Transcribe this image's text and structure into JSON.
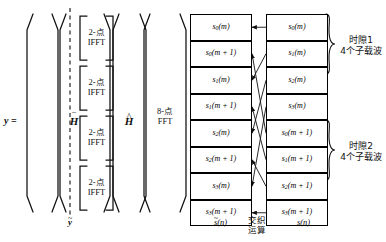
{
  "equation": {
    "lhs": "y =",
    "matrix_1": "H",
    "matrix_1_accent": "bar",
    "matrix_2": "H",
    "matrix_2_accent": "hat"
  },
  "ifft_blocks": [
    {
      "line1": "2-点",
      "line2": "IFFT"
    },
    {
      "line1": "2-点",
      "line2": "IFFT"
    },
    {
      "line1": "2-点",
      "line2": "IFFT"
    },
    {
      "line1": "2-点",
      "line2": "IFFT"
    }
  ],
  "fft_block": {
    "line1": "8-点",
    "line2": "FFT"
  },
  "intermediate_label": {
    "base": "y",
    "accent": "tilde"
  },
  "left_column": {
    "name": "s-tilde-column",
    "bottom_label": {
      "base": "s",
      "accent": "tilde",
      "arg": "(n)"
    },
    "cells": [
      {
        "sym": "s",
        "sub": "0",
        "arg": "(m)"
      },
      {
        "sym": "s",
        "sub": "0",
        "arg": "(m + 1)"
      },
      {
        "sym": "s",
        "sub": "1",
        "arg": "(m)"
      },
      {
        "sym": "s",
        "sub": "1",
        "arg": "(m + 1)"
      },
      {
        "sym": "s",
        "sub": "2",
        "arg": "(m)"
      },
      {
        "sym": "s",
        "sub": "2",
        "arg": "(m + 1)"
      },
      {
        "sym": "s",
        "sub": "3",
        "arg": "(m)"
      },
      {
        "sym": "s",
        "sub": "3",
        "arg": "(m + 1)"
      }
    ]
  },
  "right_column": {
    "name": "s-column",
    "bottom_label": {
      "base": "s",
      "accent": "none",
      "arg": "(n)"
    },
    "cells": [
      {
        "sym": "s",
        "sub": "0",
        "arg": "(m)"
      },
      {
        "sym": "s",
        "sub": "1",
        "arg": "(m)"
      },
      {
        "sym": "s",
        "sub": "2",
        "arg": "(m)"
      },
      {
        "sym": "s",
        "sub": "3",
        "arg": "(m)"
      },
      {
        "sym": "s",
        "sub": "0",
        "arg": "(m + 1)"
      },
      {
        "sym": "s",
        "sub": "1",
        "arg": "(m + 1)"
      },
      {
        "sym": "s",
        "sub": "2",
        "arg": "(m + 1)"
      },
      {
        "sym": "s",
        "sub": "3",
        "arg": "(m + 1)"
      }
    ]
  },
  "middle_label": {
    "line1": "交织",
    "line2": "运算"
  },
  "braces": [
    {
      "line1": "时隙1",
      "line2": "4个子载波"
    },
    {
      "line1": "时隙2",
      "line2": "4个子载波"
    }
  ],
  "mapping": [
    {
      "from": 0,
      "to": 0
    },
    {
      "from": 1,
      "to": 2
    },
    {
      "from": 2,
      "to": 4
    },
    {
      "from": 3,
      "to": 6
    },
    {
      "from": 4,
      "to": 1
    },
    {
      "from": 5,
      "to": 3
    },
    {
      "from": 6,
      "to": 5
    },
    {
      "from": 7,
      "to": 7
    }
  ],
  "colors": {
    "ink": "#111111",
    "line": "#000000",
    "background": "#ffffff"
  }
}
